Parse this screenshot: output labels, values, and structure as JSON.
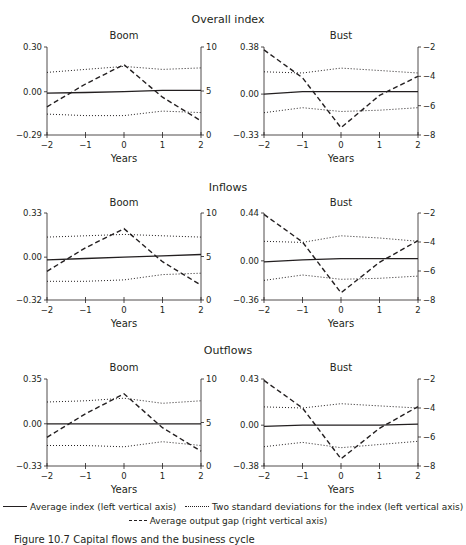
{
  "chart_data": [
    {
      "type": "line",
      "group": "Overall index",
      "title": "Boom",
      "x": [
        -2,
        -1,
        0,
        1,
        2
      ],
      "xlabel": "Years",
      "ylim_left": [
        -0.29,
        0.3
      ],
      "yticks_left": [
        "0.30",
        "0.00",
        "−0.29"
      ],
      "ylim_right": [
        0,
        10
      ],
      "yticks_right": [
        "10",
        "5",
        "0"
      ],
      "series": [
        {
          "name": "Average index (left vertical axis)",
          "axis": "left",
          "style": "solid",
          "values": [
            -0.01,
            -0.005,
            0.0,
            0.01,
            0.01
          ]
        },
        {
          "name": "Two standard deviations upper (left vertical axis)",
          "axis": "left",
          "style": "dotted",
          "values": [
            0.13,
            0.15,
            0.17,
            0.15,
            0.16
          ]
        },
        {
          "name": "Two standard deviations lower (left vertical axis)",
          "axis": "left",
          "style": "dotted",
          "values": [
            -0.15,
            -0.16,
            -0.16,
            -0.13,
            -0.14
          ]
        },
        {
          "name": "Average output gap (right vertical axis)",
          "axis": "right",
          "style": "dashed",
          "values": [
            3.2,
            5.8,
            8.0,
            4.3,
            1.6
          ]
        }
      ]
    },
    {
      "type": "line",
      "group": "Overall index",
      "title": "Bust",
      "x": [
        -2,
        -1,
        0,
        1,
        2
      ],
      "xlabel": "Years",
      "ylim_left": [
        -0.33,
        0.38
      ],
      "yticks_left": [
        "0.38",
        "0.00",
        "−0.33"
      ],
      "ylim_right": [
        -8,
        -2
      ],
      "yticks_right": [
        "−2",
        "−4",
        "−6",
        "−8"
      ],
      "series": [
        {
          "name": "Average index (left vertical axis)",
          "axis": "left",
          "style": "solid",
          "values": [
            0.0,
            0.02,
            0.02,
            0.02,
            0.02
          ]
        },
        {
          "name": "Two standard deviations upper (left vertical axis)",
          "axis": "left",
          "style": "dotted",
          "values": [
            0.18,
            0.17,
            0.21,
            0.19,
            0.17
          ]
        },
        {
          "name": "Two standard deviations lower (left vertical axis)",
          "axis": "left",
          "style": "dotted",
          "values": [
            -0.15,
            -0.11,
            -0.14,
            -0.13,
            -0.11
          ]
        },
        {
          "name": "Average output gap (right vertical axis)",
          "axis": "right",
          "style": "dashed",
          "values": [
            -2.2,
            -4.1,
            -7.5,
            -5.3,
            -4.0
          ]
        }
      ]
    },
    {
      "type": "line",
      "group": "Inflows",
      "title": "Boom",
      "x": [
        -2,
        -1,
        0,
        1,
        2
      ],
      "xlabel": "Years",
      "ylim_left": [
        -0.32,
        0.33
      ],
      "yticks_left": [
        "0.33",
        "0.00",
        "−0.32"
      ],
      "ylim_right": [
        0,
        10
      ],
      "yticks_right": [
        "10",
        "5",
        "0"
      ],
      "series": [
        {
          "name": "Average index (left vertical axis)",
          "axis": "left",
          "style": "solid",
          "values": [
            -0.02,
            -0.01,
            0.0,
            0.01,
            0.02
          ]
        },
        {
          "name": "Two standard deviations upper (left vertical axis)",
          "axis": "left",
          "style": "dotted",
          "values": [
            0.15,
            0.16,
            0.17,
            0.16,
            0.15
          ]
        },
        {
          "name": "Two standard deviations lower (left vertical axis)",
          "axis": "left",
          "style": "dotted",
          "values": [
            -0.18,
            -0.18,
            -0.17,
            -0.13,
            -0.12
          ]
        },
        {
          "name": "Average output gap (right vertical axis)",
          "axis": "right",
          "style": "dashed",
          "values": [
            3.3,
            6.0,
            8.2,
            4.4,
            1.7
          ]
        }
      ]
    },
    {
      "type": "line",
      "group": "Inflows",
      "title": "Bust",
      "x": [
        -2,
        -1,
        0,
        1,
        2
      ],
      "xlabel": "Years",
      "ylim_left": [
        -0.36,
        0.44
      ],
      "yticks_left": [
        "0.44",
        "0.00",
        "−0.36"
      ],
      "ylim_right": [
        -8,
        -2
      ],
      "yticks_right": [
        "−2",
        "−4",
        "−6",
        "−8"
      ],
      "series": [
        {
          "name": "Average index (left vertical axis)",
          "axis": "left",
          "style": "solid",
          "values": [
            -0.01,
            0.01,
            0.02,
            0.02,
            0.02
          ]
        },
        {
          "name": "Two standard deviations upper (left vertical axis)",
          "axis": "left",
          "style": "dotted",
          "values": [
            0.18,
            0.17,
            0.23,
            0.21,
            0.18
          ]
        },
        {
          "name": "Two standard deviations lower (left vertical axis)",
          "axis": "left",
          "style": "dotted",
          "values": [
            -0.18,
            -0.13,
            -0.17,
            -0.16,
            -0.14
          ]
        },
        {
          "name": "Average output gap (right vertical axis)",
          "axis": "right",
          "style": "dashed",
          "values": [
            -2.1,
            -4.0,
            -7.5,
            -5.4,
            -3.9
          ]
        }
      ]
    },
    {
      "type": "line",
      "group": "Outflows",
      "title": "Boom",
      "x": [
        -2,
        -1,
        0,
        1,
        2
      ],
      "xlabel": "Years",
      "ylim_left": [
        -0.33,
        0.35
      ],
      "yticks_left": [
        "0.35",
        "0.00",
        "−0.33"
      ],
      "ylim_right": [
        0,
        10
      ],
      "yticks_right": [
        "10",
        "5",
        "0"
      ],
      "series": [
        {
          "name": "Average index (left vertical axis)",
          "axis": "left",
          "style": "solid",
          "values": [
            0.0,
            0.0,
            0.0,
            0.0,
            0.0
          ]
        },
        {
          "name": "Two standard deviations upper (left vertical axis)",
          "axis": "left",
          "style": "dotted",
          "values": [
            0.17,
            0.18,
            0.2,
            0.16,
            0.18
          ]
        },
        {
          "name": "Two standard deviations lower (left vertical axis)",
          "axis": "left",
          "style": "dotted",
          "values": [
            -0.17,
            -0.17,
            -0.18,
            -0.14,
            -0.17
          ]
        },
        {
          "name": "Average output gap (right vertical axis)",
          "axis": "right",
          "style": "dashed",
          "values": [
            3.3,
            6.0,
            8.3,
            4.4,
            1.7
          ]
        }
      ]
    },
    {
      "type": "line",
      "group": "Outflows",
      "title": "Bust",
      "x": [
        -2,
        -1,
        0,
        1,
        2
      ],
      "xlabel": "Years",
      "ylim_left": [
        -0.38,
        0.43
      ],
      "yticks_left": [
        "0.43",
        "0.00",
        "−0.38"
      ],
      "ylim_right": [
        -8,
        -2
      ],
      "yticks_right": [
        "−2",
        "−4",
        "−6",
        "−8"
      ],
      "series": [
        {
          "name": "Average index (left vertical axis)",
          "axis": "left",
          "style": "solid",
          "values": [
            -0.01,
            0.0,
            0.0,
            0.0,
            0.01
          ]
        },
        {
          "name": "Two standard deviations upper (left vertical axis)",
          "axis": "left",
          "style": "dotted",
          "values": [
            0.17,
            0.16,
            0.2,
            0.18,
            0.16
          ]
        },
        {
          "name": "Two standard deviations lower (left vertical axis)",
          "axis": "left",
          "style": "dotted",
          "values": [
            -0.2,
            -0.16,
            -0.21,
            -0.18,
            -0.15
          ]
        },
        {
          "name": "Average output gap (right vertical axis)",
          "axis": "right",
          "style": "dashed",
          "values": [
            -2.1,
            -4.0,
            -7.5,
            -5.4,
            -3.9
          ]
        }
      ]
    }
  ],
  "groups": [
    "Overall index",
    "Inflows",
    "Outflows"
  ],
  "legend": {
    "solid": "Average index (left vertical axis)",
    "dotted": "Two standard deviations for the index (left vertical axis)",
    "dashed": "Average output gap (right vertical axis)"
  },
  "caption": "Figure 10.7  Capital flows and the business cycle"
}
